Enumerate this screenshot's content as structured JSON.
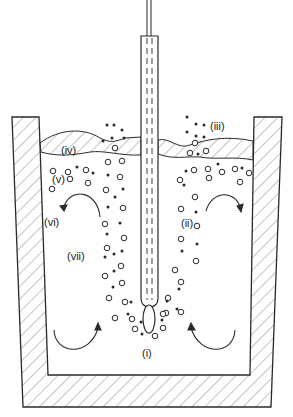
{
  "figure": {
    "stroke_color": "#2a2a2a",
    "background": "#ffffff"
  },
  "labels": {
    "i": "(i)",
    "ii": "(ii)",
    "iii": "(iii)",
    "iv": "(iv)",
    "v": "(v)",
    "vi": "(vi)",
    "vii": "(vii)"
  },
  "components": [
    "vessel-refractory-wall",
    "lance",
    "gas-bubble-at-tip",
    "slag-layer",
    "bubbles",
    "droplets",
    "circulation-arrows"
  ]
}
